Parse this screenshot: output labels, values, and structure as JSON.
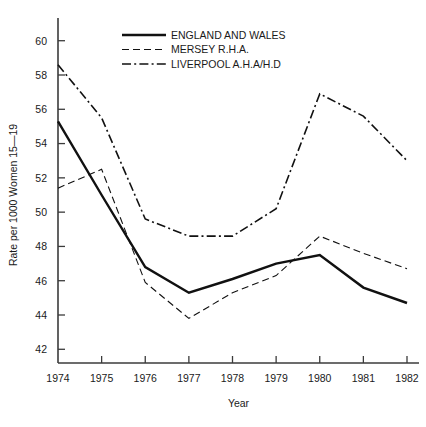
{
  "chart_data": {
    "type": "line",
    "title": "",
    "xlabel": "Year",
    "ylabel": "Rate per 1000 Women 15—19",
    "x": [
      1974,
      1975,
      1976,
      1977,
      1978,
      1979,
      1980,
      1981,
      1982
    ],
    "xticklabels": [
      "1974",
      "1975",
      "1976",
      "1977",
      "1978",
      "1979",
      "1980",
      "1981",
      "1982"
    ],
    "yticklabels": [
      "42",
      "44",
      "46",
      "48",
      "50",
      "52",
      "54",
      "56",
      "58",
      "60"
    ],
    "yticks": [
      42,
      44,
      46,
      48,
      50,
      52,
      54,
      56,
      58,
      60
    ],
    "xlim": [
      1974,
      1982
    ],
    "ylim": [
      41.2,
      60.8
    ],
    "grid": false,
    "legend_position": "top-center",
    "series": [
      {
        "name": "ENGLAND AND WALES",
        "style": "solid",
        "color": "#111111",
        "values": [
          55.3,
          51.0,
          46.8,
          45.3,
          46.1,
          47.0,
          47.5,
          45.6,
          44.7
        ]
      },
      {
        "name": "MERSEY R.H.A.",
        "style": "dashed",
        "color": "#111111",
        "values": [
          51.4,
          52.5,
          45.9,
          43.8,
          45.3,
          46.3,
          48.6,
          47.6,
          46.7
        ]
      },
      {
        "name": "LIVERPOOL A.H.A/H.D",
        "style": "dash-dot",
        "color": "#111111",
        "values": [
          58.6,
          55.5,
          49.6,
          48.6,
          48.6,
          50.2,
          56.9,
          55.6,
          53.0
        ]
      }
    ]
  },
  "legend": {
    "items": [
      {
        "label": "ENGLAND AND WALES",
        "style": "solid"
      },
      {
        "label": "MERSEY R.H.A.",
        "style": "dashed"
      },
      {
        "label": "LIVERPOOL A.H.A/H.D",
        "style": "dash-dot"
      }
    ]
  }
}
